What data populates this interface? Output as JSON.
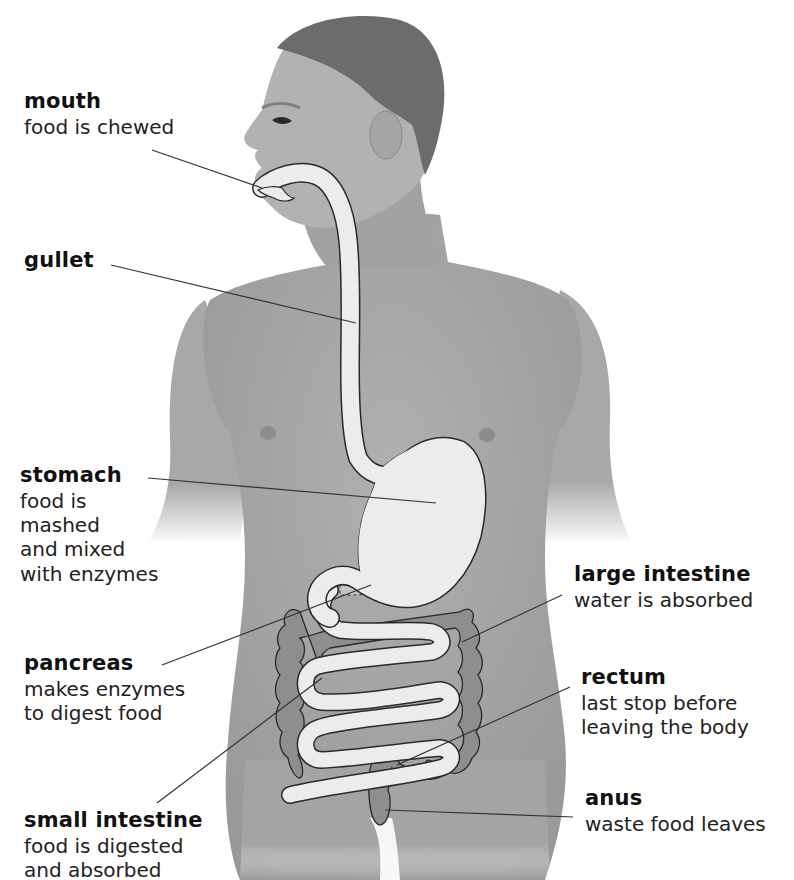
{
  "diagram": {
    "colors": {
      "background": "#ffffff",
      "body": "#a8a8a8",
      "body_shadow": "#8f8f8f",
      "hair": "#6a6a6a",
      "organ_fill": "#ececec",
      "colon_fill": "#8c8c8c",
      "outline": "#333333",
      "text": "#1a1a1a",
      "leader_line": "#333333"
    },
    "labels": [
      {
        "id": "mouth",
        "title": "mouth",
        "desc": [
          "food is chewed"
        ]
      },
      {
        "id": "gullet",
        "title": "gullet",
        "desc": []
      },
      {
        "id": "stomach",
        "title": "stomach",
        "desc": [
          "food is",
          "mashed",
          "and mixed",
          "with enzymes"
        ]
      },
      {
        "id": "pancreas",
        "title": "pancreas",
        "desc": [
          "makes enzymes",
          "to digest food"
        ]
      },
      {
        "id": "small_intestine",
        "title": "small intestine",
        "desc": [
          "food is digested",
          "and absorbed"
        ]
      },
      {
        "id": "large_intestine",
        "title": "large intestine",
        "desc": [
          "water is absorbed"
        ]
      },
      {
        "id": "rectum",
        "title": "rectum",
        "desc": [
          "last stop before",
          "leaving the body"
        ]
      },
      {
        "id": "anus",
        "title": "anus",
        "desc": [
          "waste food leaves"
        ]
      }
    ]
  }
}
